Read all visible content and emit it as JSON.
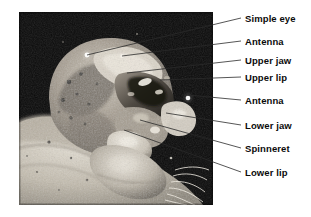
{
  "figure": {
    "type": "labeled-photomicrograph",
    "background_color": "#ffffff",
    "photo": {
      "name": "caterpillar-head-photo",
      "x": 19,
      "y": 12,
      "width": 194,
      "height": 193,
      "background_color": "#080808",
      "description": "Black and white magnified photograph of a caterpillar head"
    },
    "leader_line_color": "#2b2b2b"
  },
  "labels": [
    {
      "id": "simple-eye",
      "text": "Simple eye",
      "text_x": 245,
      "text_y": 18,
      "line_from_x": 87,
      "line_from_y": 55,
      "line_to_x": 241,
      "line_to_y": 18
    },
    {
      "id": "antenna-upper",
      "text": "Antenna",
      "text_x": 245,
      "text_y": 41,
      "line_from_x": 122,
      "line_from_y": 56,
      "line_to_x": 241,
      "line_to_y": 41
    },
    {
      "id": "upper-jaw",
      "text": "Upper jaw",
      "text_x": 245,
      "text_y": 60,
      "line_from_x": 127,
      "line_from_y": 73,
      "line_to_x": 241,
      "line_to_y": 60
    },
    {
      "id": "upper-lip",
      "text": "Upper lip",
      "text_x": 245,
      "text_y": 77,
      "line_from_x": 160,
      "line_from_y": 80,
      "line_to_x": 241,
      "line_to_y": 77
    },
    {
      "id": "antenna-lower",
      "text": "Antenna",
      "text_x": 245,
      "text_y": 100,
      "line_from_x": 188,
      "line_from_y": 95,
      "line_to_x": 241,
      "line_to_y": 100
    },
    {
      "id": "lower-jaw",
      "text": "Lower jaw",
      "text_x": 245,
      "text_y": 125,
      "line_from_x": 166,
      "line_from_y": 113,
      "line_to_x": 241,
      "line_to_y": 125
    },
    {
      "id": "spinneret",
      "text": "Spinneret",
      "text_x": 245,
      "text_y": 148,
      "line_from_x": 140,
      "line_from_y": 120,
      "line_to_x": 241,
      "line_to_y": 148
    },
    {
      "id": "lower-lip",
      "text": "Lower lip",
      "text_x": 245,
      "text_y": 172,
      "line_from_x": 124,
      "line_from_y": 130,
      "line_to_x": 241,
      "line_to_y": 172
    }
  ]
}
